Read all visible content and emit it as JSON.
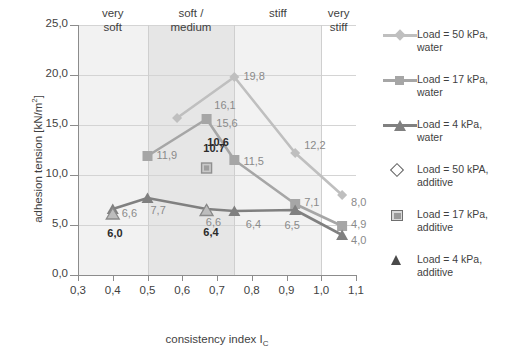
{
  "chart_data": {
    "type": "line",
    "title": "",
    "xlabel": "consistency index I_C",
    "ylabel": "adhesion tension [kN/m²]",
    "xlim": [
      0.3,
      1.1
    ],
    "ylim": [
      0.0,
      25.0
    ],
    "xticks": [
      "0,3",
      "0,4",
      "0,5",
      "0,6",
      "0,7",
      "0,8",
      "0,9",
      "1,0",
      "1,1"
    ],
    "yticks": [
      "0,0",
      "5,0",
      "10,0",
      "15,0",
      "20,0",
      "25,0"
    ],
    "grid": true,
    "legend_position": "right",
    "zones": [
      {
        "label": "very\nsoft",
        "line1": "very",
        "line2": "soft",
        "from": 0.3,
        "to": 0.5
      },
      {
        "label": "soft / medium",
        "line1": "soft /",
        "line2": "medium",
        "from": 0.5,
        "to": 0.75
      },
      {
        "label": "stiff",
        "line1": "stiff",
        "line2": "",
        "from": 0.75,
        "to": 1.0
      },
      {
        "label": "very stiff",
        "line1": "very",
        "line2": "stiff",
        "from": 1.0,
        "to": 1.1
      }
    ],
    "series": [
      {
        "name": "Load = 50 kPa, water",
        "marker": "diamond",
        "color": "#bfbfbf",
        "x": [
          0.585,
          0.75,
          0.925,
          1.06
        ],
        "y": [
          15.7,
          19.8,
          12.2,
          8.0
        ],
        "point_labels": [
          "",
          "19,8",
          "12,2",
          "8,0"
        ]
      },
      {
        "name": "Load = 17 kPa, water",
        "marker": "square",
        "color": "#a6a6a6",
        "x": [
          0.5,
          0.67,
          0.75,
          0.925,
          1.06
        ],
        "y": [
          11.9,
          15.6,
          11.5,
          7.1,
          4.9
        ],
        "point_labels": [
          "11,9",
          "15,6",
          "11,5",
          "7,1",
          "4,9"
        ]
      },
      {
        "name": "Load = 4 kPa, water",
        "marker": "triangle",
        "color": "#808080",
        "x": [
          0.4,
          0.5,
          0.67,
          0.75,
          0.925,
          1.06
        ],
        "y": [
          6.6,
          7.7,
          6.6,
          6.4,
          6.5,
          4.0
        ],
        "point_labels": [
          "6,6",
          "7,7",
          "6,6",
          "6,4",
          "6,5",
          "4,0"
        ]
      }
    ],
    "additive_points": [
      {
        "name": "Load = 17 kPa, additive",
        "marker": "square-outline",
        "x": 0.67,
        "y": 10.7,
        "label": "10.7"
      },
      {
        "name": "Load = 4 kPa, additive",
        "marker": "triangle",
        "x": 0.4,
        "y": 6.1,
        "label": "6,0"
      },
      {
        "name": "Load = 4 kPa, additive",
        "marker": "triangle",
        "x": 0.67,
        "y": 6.45,
        "label": "6,4"
      }
    ],
    "extra_labels": [
      {
        "text": "16,1",
        "x": 0.675,
        "y": 16.9
      },
      {
        "text": "10,6",
        "x": 0.655,
        "y": 13.2
      }
    ],
    "legend": [
      {
        "label_line1": "Load = 50 kPa,",
        "label_line2": "water",
        "marker": "line-diamond",
        "color": "#bfbfbf"
      },
      {
        "label_line1": "Load = 17 kPa,",
        "label_line2": "water",
        "marker": "line-square",
        "color": "#a6a6a6"
      },
      {
        "label_line1": "Load = 4 kPa,",
        "label_line2": "water",
        "marker": "line-triangle",
        "color": "#808080"
      },
      {
        "label_line1": "Load = 50 kPA,",
        "label_line2": "additive",
        "marker": "diamond-open",
        "color": "#5d5d5d"
      },
      {
        "label_line1": "Load = 17 kPa,",
        "label_line2": "additive",
        "marker": "square-open",
        "color": "#6f6f6f"
      },
      {
        "label_line1": "Load = 4 kPa,",
        "label_line2": "additive",
        "marker": "triangle-filled",
        "color": "#4a4a4a"
      }
    ]
  }
}
